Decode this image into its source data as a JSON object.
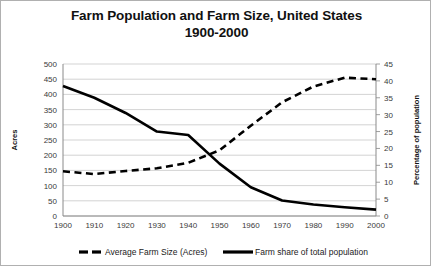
{
  "chart_data": {
    "type": "line",
    "title": "Farm Population and Farm Size, United States",
    "subtitle": "1900-2000",
    "title_line1": "Farm Population and Farm Size, United States",
    "title_line2": "1900-2000",
    "xlabel": "",
    "ylabel": "Acres",
    "y2label": "Percentage of population",
    "grid": true,
    "legend_position": "bottom",
    "x": [
      1900,
      1910,
      1920,
      1930,
      1940,
      1950,
      1960,
      1970,
      1980,
      1990,
      2000
    ],
    "categories": [
      "1900",
      "1910",
      "1920",
      "1930",
      "1940",
      "1950",
      "1960",
      "1970",
      "1980",
      "1990",
      "2000"
    ],
    "ylim": [
      0,
      500
    ],
    "yticks": [
      0,
      50,
      100,
      150,
      200,
      250,
      300,
      350,
      400,
      450,
      500
    ],
    "ytick_labels": [
      "0",
      "50",
      "100",
      "150",
      "200",
      "250",
      "300",
      "350",
      "400",
      "450",
      "500"
    ],
    "y2lim": [
      0,
      45
    ],
    "y2ticks": [
      0,
      5,
      10,
      15,
      20,
      25,
      30,
      35,
      40,
      45
    ],
    "y2tick_labels": [
      "0",
      "5",
      "10",
      "15",
      "20",
      "25",
      "30",
      "35",
      "40",
      "45"
    ],
    "series": [
      {
        "name": "Average Farm Size (Acres)",
        "axis": "left",
        "style": "dashed",
        "color": "#000000",
        "values": [
          147,
          138,
          148,
          157,
          175,
          216,
          297,
          374,
          426,
          455,
          450
        ]
      },
      {
        "name": "Farm share of total population",
        "axis": "right",
        "style": "solid",
        "color": "#000000",
        "values": [
          38.5,
          35.0,
          30.5,
          25.0,
          24.0,
          15.5,
          8.5,
          4.6,
          3.4,
          2.6,
          1.9
        ]
      }
    ]
  },
  "legend": {
    "items": [
      {
        "label": "Average Farm Size (Acres)",
        "style": "dashed"
      },
      {
        "label": "Farm share of total population",
        "style": "solid"
      }
    ]
  }
}
